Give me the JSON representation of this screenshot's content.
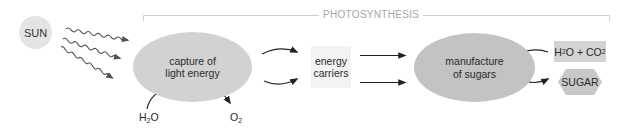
{
  "diagram": {
    "title": "PHOTOSYNTHESIS",
    "colors": {
      "bracket": "#cfcfcf",
      "title_text": "#a6a6a6",
      "sun_fill": "#e4e4e4",
      "capture_fill": "#d2d2d2",
      "manufacture_fill": "#c3c3c3",
      "carriers_fill": "#f3f3f3",
      "h2o_co2_fill": "#d4d4d4",
      "sugar_fill": "#c8c8c8",
      "arrow": "#222222",
      "wavy_arrow": "#555555"
    },
    "nodes": {
      "sun": {
        "label": "SUN"
      },
      "capture": {
        "line1": "capture of",
        "line2": "light energy"
      },
      "carriers": {
        "line1": "energy",
        "line2": "carriers"
      },
      "manufacture": {
        "line1": "manufacture",
        "line2": "of sugars"
      },
      "h2o_co2": {
        "h": "H",
        "sub1": "2",
        "o": "O + CO",
        "sub2": "2"
      },
      "sugar": {
        "label": "SUGAR"
      },
      "h2o_in": {
        "h": "H",
        "sub": "2",
        "o": "O"
      },
      "o2_out": {
        "o": "O",
        "sub": "2"
      }
    },
    "edges": [
      {
        "from": "sun",
        "to": "capture",
        "style": "wavy",
        "count": 3
      },
      {
        "from": "h2o_in",
        "to": "capture",
        "style": "curved"
      },
      {
        "from": "capture",
        "to": "o2_out",
        "style": "curved"
      },
      {
        "from": "capture",
        "to": "carriers",
        "style": "curved",
        "count": 2
      },
      {
        "from": "carriers",
        "to": "manufacture",
        "style": "straight",
        "count": 2
      },
      {
        "from": "h2o_co2",
        "to": "manufacture",
        "style": "curved"
      },
      {
        "from": "manufacture",
        "to": "sugar",
        "style": "curved"
      }
    ]
  }
}
